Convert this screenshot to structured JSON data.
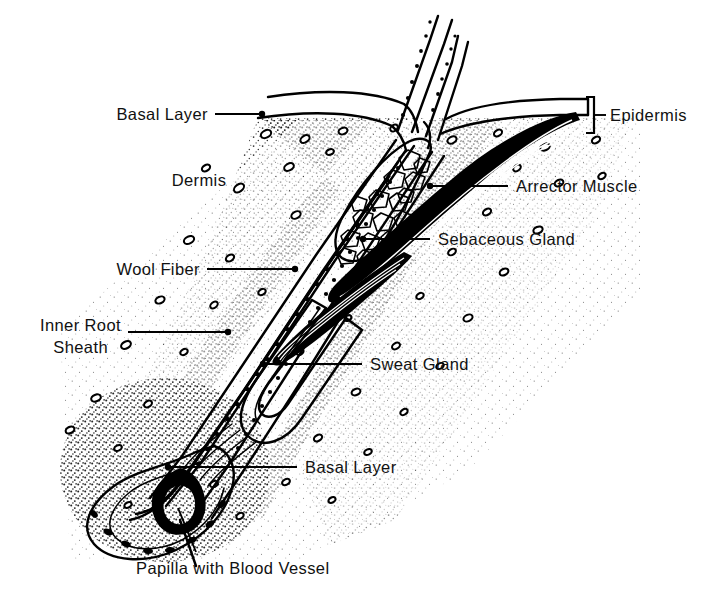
{
  "figure": {
    "background_color": "#ffffff",
    "ink_color": "#000000",
    "width": 718,
    "height": 593
  },
  "labels": {
    "basal_layer_top": "Basal Layer",
    "dermis": "Dermis",
    "wool_fiber": "Wool Fiber",
    "inner_root_line1": "Inner Root",
    "inner_root_line2": "Sheath",
    "epidermis": "Epidermis",
    "arrector_muscle": "Arrector Muscle",
    "sebaceous_gland": "Sebaceous Gland",
    "sweat_gland": "Sweat Gland",
    "basal_layer_bottom": "Basal Layer",
    "papilla": "Papilla with Blood Vessel"
  },
  "annotations": [
    {
      "name": "basal-layer-top",
      "text": "Basal Layer",
      "side": "left",
      "marker": "dot"
    },
    {
      "name": "dermis",
      "text": "Dermis",
      "side": "left",
      "marker": "none"
    },
    {
      "name": "wool-fiber",
      "text": "Wool Fiber",
      "side": "left",
      "marker": "dot"
    },
    {
      "name": "inner-root-sheath",
      "text": "Inner Root Sheath",
      "side": "left",
      "marker": "dot"
    },
    {
      "name": "epidermis",
      "text": "Epidermis",
      "side": "right",
      "marker": "bracket"
    },
    {
      "name": "arrector-muscle",
      "text": "Arrector Muscle",
      "side": "right",
      "marker": "dot"
    },
    {
      "name": "sebaceous-gland",
      "text": "Sebaceous Gland",
      "side": "right",
      "marker": "dot"
    },
    {
      "name": "sweat-gland",
      "text": "Sweat Gland",
      "side": "right",
      "marker": "dot"
    },
    {
      "name": "basal-layer-bottom",
      "text": "Basal Layer",
      "side": "right",
      "marker": "dot"
    },
    {
      "name": "papilla-with-blood-vessel",
      "text": "Papilla with Blood Vessel",
      "side": "bottom",
      "marker": "line"
    }
  ]
}
